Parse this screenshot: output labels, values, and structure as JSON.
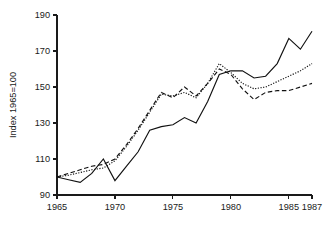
{
  "chart_data": {
    "type": "line",
    "title": "",
    "subtitle": "",
    "xlabel": "",
    "ylabel": "Index 1965=100",
    "xlim": [
      1965,
      1987
    ],
    "ylim": [
      90,
      190
    ],
    "grid": false,
    "legend": "none",
    "x_ticks": [
      1965,
      1970,
      1975,
      1980,
      1985,
      1987
    ],
    "x_tick_labels": [
      "1965",
      "1970",
      "1975",
      "1980",
      "1985",
      "1987"
    ],
    "y_ticks": [
      90,
      110,
      130,
      150,
      170,
      190
    ],
    "y_tick_labels": [
      "90",
      "110",
      "130",
      "150",
      "170",
      "190"
    ],
    "x": [
      1965,
      1966,
      1967,
      1968,
      1969,
      1970,
      1971,
      1972,
      1973,
      1974,
      1975,
      1976,
      1977,
      1978,
      1979,
      1980,
      1981,
      1982,
      1983,
      1984,
      1985,
      1986,
      1987
    ],
    "series": [
      {
        "name": "series-solid",
        "style": "solid",
        "color": "#111111",
        "values": [
          100,
          98.5,
          97,
          102,
          110,
          98,
          106,
          114,
          126,
          128,
          129,
          133,
          130,
          142,
          157,
          159,
          159,
          155,
          156,
          163,
          177,
          171,
          181
        ]
      },
      {
        "name": "series-dotted",
        "style": "dotted",
        "color": "#111111",
        "values": [
          100,
          101,
          102.5,
          104,
          105,
          109,
          117,
          126,
          136,
          146,
          145,
          147,
          144,
          152,
          163,
          158,
          152,
          149,
          150,
          153,
          156,
          159,
          163
        ]
      },
      {
        "name": "series-dashed",
        "style": "dashed",
        "color": "#111111",
        "values": [
          100,
          102,
          104,
          106,
          107,
          110,
          118,
          127,
          137,
          147,
          144,
          150,
          145,
          152,
          160,
          157,
          149,
          143,
          147,
          148,
          148,
          150,
          152
        ]
      }
    ]
  },
  "axes": {
    "y_axis_title": "Index 1965=100"
  }
}
